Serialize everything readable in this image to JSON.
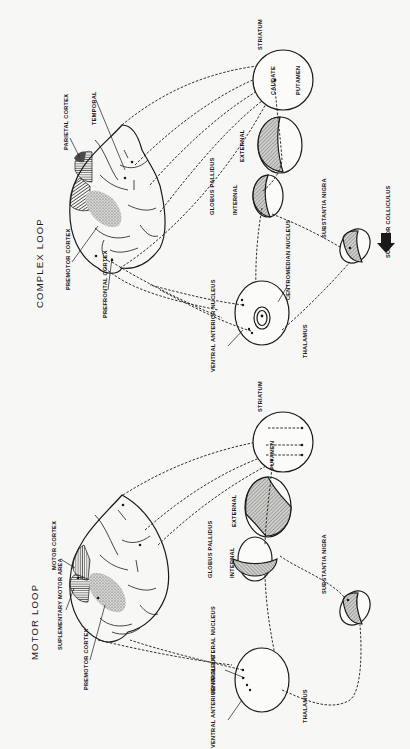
{
  "figure": {
    "orientation": "rotated-90-ccw",
    "panels": [
      {
        "id": "motor",
        "title": "MOTOR LOOP",
        "cortex_labels": {
          "motor_cortex": "MOTOR CORTEX",
          "supplementary_motor_area": "SUPLEMENTARY MOTOR AREA",
          "premotor_cortex": "PREMOTOR CORTEX"
        },
        "structures": {
          "striatum": "STRIATUM",
          "putamen": "PUTAMEN",
          "globus_pallidus": "GLOBUS PALLIDUS",
          "external": "EXTERNAL",
          "internal": "INTERNAL",
          "substantia_nigra": "SUBSTANTIA NIGRA",
          "ventral_lateral_nucleus": "VENTRAL LATERAL NUCLEUS",
          "ventral_anterior_nucleus": "VENTRAL ANTERIOR NUCLEUS",
          "thalamus": "THALAMUS"
        }
      },
      {
        "id": "complex",
        "title": "COMPLEX LOOP",
        "cortex_labels": {
          "parietal_cortex": "PARIETAL CORTEX",
          "temporal": "TEMPORAL",
          "premotor_cortex": "PREMOTOR CORTEX",
          "prefrontal_cortex": "PREFRONTAL CORTEX"
        },
        "structures": {
          "striatum": "STRIATUM",
          "caudate": "CAUDATE",
          "putamen": "PUTAMEN",
          "globus_pallidus": "GLOBUS PALLIDUS",
          "external": "EXTERNAL",
          "internal": "INTERNAL",
          "substantia_nigra": "SUBSTANTIA NIGRA",
          "superior_colliculus": "SUPERIOR COLLICULUS",
          "centromedian_nucleus": "CENTROMEDIAN NUCLEUS",
          "ventral_anterior_nucleus": "VENTRAL ANTERIOR NUCLEUS",
          "thalamus": "THALAMUS"
        }
      }
    ]
  }
}
